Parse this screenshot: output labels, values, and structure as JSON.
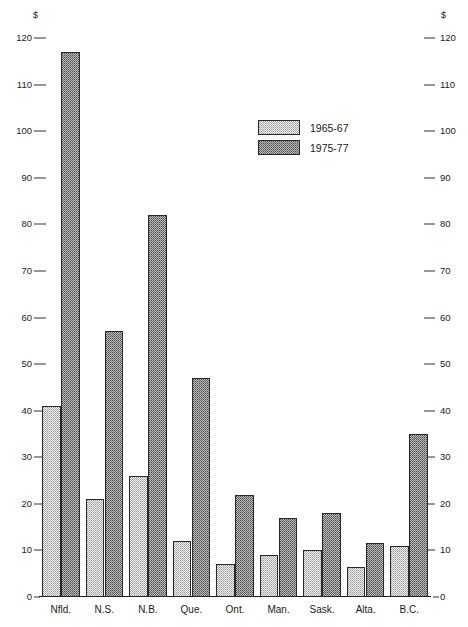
{
  "chart_data": {
    "type": "bar",
    "title": "",
    "xlabel": "",
    "ylabel": "$",
    "ylim": [
      0,
      120
    ],
    "ytick_step": 10,
    "yticks": [
      0,
      10,
      20,
      30,
      40,
      50,
      60,
      70,
      80,
      90,
      100,
      110,
      120
    ],
    "grid": false,
    "left_axis_unit": "$",
    "right_axis_unit": "$",
    "dual_axis": true,
    "legend_position": "upper-center",
    "categories": [
      "Nfld.",
      "N.S.",
      "N.B.",
      "Que.",
      "Ont.",
      "Man.",
      "Sask.",
      "Alta.",
      "B.C."
    ],
    "series": [
      {
        "name": "1965-67",
        "fill": "light-stipple",
        "values": [
          41,
          21,
          26,
          12,
          7,
          9,
          10,
          6.5,
          11
        ]
      },
      {
        "name": "1975-77",
        "fill": "dark-stipple",
        "values": [
          117,
          57,
          82,
          47,
          22,
          17,
          18,
          11.5,
          35
        ]
      }
    ]
  },
  "axis": {
    "unit_symbol": "$",
    "tick_labels": [
      "120",
      "110",
      "100",
      "90",
      "80",
      "70",
      "60",
      "50",
      "40",
      "30",
      "20",
      "10",
      "0"
    ]
  },
  "legend": {
    "items": [
      {
        "label": "1965-67",
        "style": "s1"
      },
      {
        "label": "1975-77",
        "style": "s2"
      }
    ]
  },
  "colors": {
    "axis": "#1a1a1a",
    "text": "#1a1a1a",
    "series1_fill": "#eeeeee",
    "series2_fill": "#bdbdbd",
    "bar_border": "#2a2a2a",
    "background": "#ffffff"
  }
}
